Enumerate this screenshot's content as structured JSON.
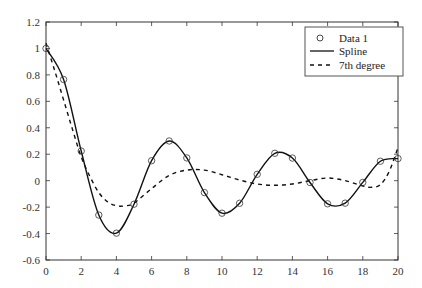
{
  "chart_data": {
    "type": "line",
    "title": "",
    "xlabel": "",
    "ylabel": "",
    "xlim": [
      0,
      20
    ],
    "ylim": [
      -0.6,
      1.2
    ],
    "xticks": [
      0,
      2,
      4,
      6,
      8,
      10,
      12,
      14,
      16,
      18,
      20
    ],
    "yticks": [
      -0.6,
      -0.4,
      -0.2,
      0,
      0.2,
      0.4,
      0.6,
      0.8,
      1,
      1.2
    ],
    "ytick_labels": [
      "-0.6",
      "-0.4",
      "-0.2",
      "0",
      "0.2",
      "0.4",
      "0.6",
      "0.8",
      "1",
      "1.2"
    ],
    "xtick_labels": [
      "0",
      "2",
      "4",
      "6",
      "8",
      "10",
      "12",
      "14",
      "16",
      "18",
      "20"
    ],
    "grid": false,
    "box": true,
    "legend_position": "upper right",
    "series": [
      {
        "name": "Data 1",
        "style": "markers-circle",
        "x": [
          0,
          1,
          2,
          3,
          4,
          5,
          6,
          7,
          8,
          9,
          10,
          11,
          12,
          13,
          14,
          15,
          16,
          17,
          18,
          19,
          20
        ],
        "y": [
          1.0,
          0.765,
          0.224,
          -0.26,
          -0.397,
          -0.178,
          0.151,
          0.3,
          0.172,
          -0.09,
          -0.246,
          -0.171,
          0.048,
          0.207,
          0.171,
          -0.014,
          -0.175,
          -0.17,
          -0.013,
          0.147,
          0.167
        ]
      },
      {
        "name": "Spline",
        "style": "solid",
        "x": [
          0,
          1,
          2,
          3,
          4,
          5,
          6,
          7,
          8,
          9,
          10,
          11,
          12,
          13,
          14,
          15,
          16,
          17,
          18,
          19,
          20
        ],
        "y": [
          1.0,
          0.765,
          0.224,
          -0.26,
          -0.397,
          -0.178,
          0.151,
          0.3,
          0.172,
          -0.09,
          -0.246,
          -0.171,
          0.048,
          0.207,
          0.171,
          -0.014,
          -0.175,
          -0.17,
          -0.013,
          0.147,
          0.167
        ]
      },
      {
        "name": "7th degree",
        "style": "dashed",
        "x": [
          0,
          0.5,
          1,
          1.5,
          2,
          2.5,
          3,
          3.5,
          4,
          4.5,
          5,
          6,
          7,
          8,
          9,
          10,
          11,
          12,
          13,
          14,
          15,
          16,
          17,
          18,
          18.5,
          19,
          19.5,
          20
        ],
        "y": [
          1.04,
          0.83,
          0.61,
          0.39,
          0.18,
          0.03,
          -0.09,
          -0.16,
          -0.19,
          -0.19,
          -0.17,
          -0.06,
          0.04,
          0.08,
          0.08,
          0.045,
          0.005,
          -0.025,
          -0.035,
          -0.025,
          0.0,
          0.02,
          0.0,
          -0.04,
          -0.05,
          -0.03,
          0.07,
          0.25
        ]
      }
    ]
  },
  "legend": {
    "items": [
      {
        "label": "Data 1",
        "symbol": "circle-marker"
      },
      {
        "label": "Spline",
        "symbol": "solid-line"
      },
      {
        "label": "7th degree",
        "symbol": "dashed-line"
      }
    ]
  },
  "colors": {
    "line": "#111111",
    "axis": "#333333",
    "background": "#ffffff"
  }
}
